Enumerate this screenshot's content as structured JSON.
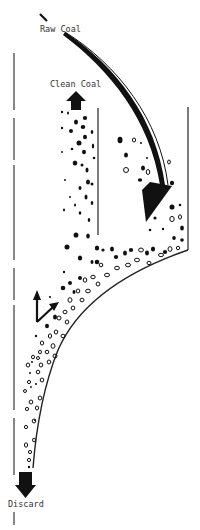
{
  "diagram": {
    "type": "coal-cleaning-separator-flow",
    "labels": {
      "raw_coal": "Raw Coal",
      "clean_coal": "Clean Coal",
      "discard": "Discard"
    },
    "colors": {
      "background": "#ffffff",
      "ink": "#111111",
      "wall": "#444444",
      "label": "#333333"
    },
    "flows": [
      {
        "name": "raw-coal-feed",
        "direction": "down-into-vessel"
      },
      {
        "name": "clean-coal-out",
        "direction": "up"
      },
      {
        "name": "discard-out",
        "direction": "down"
      }
    ],
    "particles": {
      "solid": "coal (light)",
      "hollow": "refuse (heavy)"
    }
  }
}
